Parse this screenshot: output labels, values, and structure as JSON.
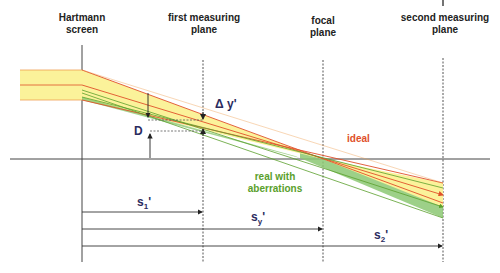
{
  "labels": {
    "hartmann_screen": [
      "Hartmann",
      "screen"
    ],
    "first_plane": [
      "first measuring",
      "plane"
    ],
    "focal_plane": [
      "focal",
      "plane"
    ],
    "second_plane": [
      "second measuring",
      "plane"
    ]
  },
  "symbols": {
    "delta_y": "Δ y'",
    "D": "D",
    "s1": "s",
    "s1_sub": "1",
    "sy": "s",
    "sy_sub": "y",
    "s2": "s",
    "s2_sub": "2",
    "prime": "'"
  },
  "rays": {
    "ideal_label": "ideal",
    "real_label": [
      "real with",
      "aberrations"
    ]
  },
  "colors": {
    "ideal": "#e0502a",
    "real": "#5aa02c",
    "beam_fill": "#fbf29a",
    "real_fill": "#8cc873",
    "axis": "#333333"
  }
}
